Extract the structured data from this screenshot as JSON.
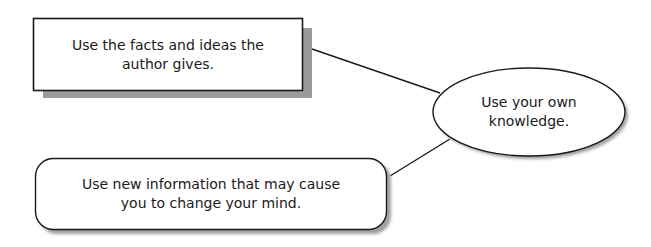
{
  "diagram": {
    "nodes": [
      {
        "id": "facts",
        "shape": "rectangle",
        "lines": [
          "Use the facts and ideas the",
          "author gives."
        ]
      },
      {
        "id": "knowledge",
        "shape": "ellipse",
        "lines": [
          "Use your own",
          "knowledge."
        ]
      },
      {
        "id": "new_info",
        "shape": "rounded-rectangle",
        "lines": [
          "Use new information that may cause",
          "you to change your mind."
        ]
      }
    ],
    "edges": [
      {
        "from": "facts",
        "to": "knowledge"
      },
      {
        "from": "new_info",
        "to": "knowledge"
      }
    ],
    "colors": {
      "stroke": "#1a1a1a",
      "shadow": "#9a9a9a",
      "fill": "#ffffff"
    }
  }
}
